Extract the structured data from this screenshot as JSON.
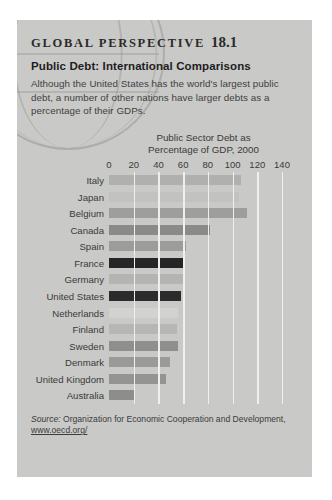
{
  "panel": {
    "kicker": "GLOBAL PERSPECTIVE",
    "number": "18.1",
    "headline": "Public Debt: International Comparisons",
    "deck": "Although the United States has the world's largest public debt, a number of other nations have larger debts as a percentage of their GDPs.",
    "background_color": "#c9c9c7"
  },
  "source": {
    "label": "Source:",
    "text": "Organization for Economic Cooperation and Development,",
    "url": "www.oecd.org/"
  },
  "chart_data": {
    "type": "bar",
    "orientation": "horizontal",
    "title": "Public Sector Debt as\nPercentage of GDP, 2000",
    "xlabel": "",
    "ylabel": "",
    "xlim": [
      0,
      140
    ],
    "xticks": [
      0,
      20,
      40,
      60,
      80,
      100,
      120,
      140
    ],
    "tick_labels": [
      "0",
      "20",
      "40",
      "60",
      "80",
      "100",
      "120",
      "140"
    ],
    "grid": true,
    "legend": "none",
    "categories": [
      "Italy",
      "Japan",
      "Belgium",
      "Canada",
      "Spain",
      "France",
      "Germany",
      "United States",
      "Netherlands",
      "Finland",
      "Sweden",
      "Denmark",
      "United Kingdom",
      "Australia"
    ],
    "values": [
      107,
      105,
      112,
      82,
      62,
      60,
      60,
      58,
      56,
      55,
      56,
      49,
      46,
      21
    ],
    "bar_colors": [
      "#b0b0ae",
      "#c2c2c0",
      "#9e9e9c",
      "#8a8a88",
      "#9c9c9a",
      "#262626",
      "#b4b4b2",
      "#2b2b2b",
      "#d2d2d0",
      "#b6b6b4",
      "#8f8f8d",
      "#9a9a98",
      "#949492",
      "#8d8d8b"
    ]
  }
}
